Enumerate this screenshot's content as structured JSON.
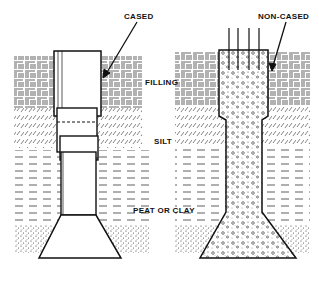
{
  "diagram": {
    "labels": {
      "cased": "CASED",
      "non_cased": "NON-CASED",
      "filling": "FILLING",
      "silt": "SILT",
      "peat_or_clay": "PEAT OR CLAY"
    },
    "layers": [
      "filling",
      "silt",
      "peat_or_clay",
      "bearing_stratum"
    ],
    "piles": [
      {
        "name": "cased",
        "type": "cased pile with enlarged base"
      },
      {
        "name": "non-cased",
        "type": "non-cased concrete pile with enlarged base and reinforcing bars"
      }
    ],
    "colors": {
      "ink": "#111111",
      "background": "#ffffff"
    }
  }
}
